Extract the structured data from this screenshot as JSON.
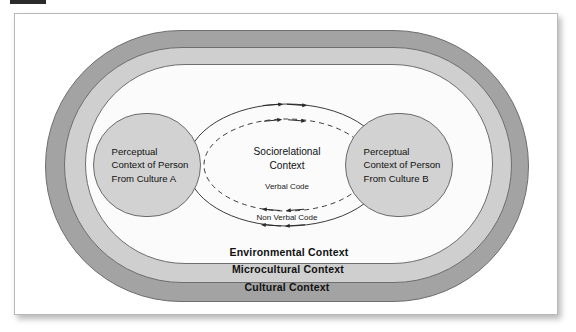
{
  "figure": {
    "bands": [
      {
        "id": "cultural",
        "label": "Cultural Context",
        "color": "#a3a3a3"
      },
      {
        "id": "microcultural",
        "label": "Microcultural Context",
        "color": "#cfcfcf"
      },
      {
        "id": "environmental",
        "label": "Environmental Context",
        "color": "#fbfbfb"
      }
    ],
    "person_a": {
      "label": "Perceptual\nContext of Person\nFrom Culture A"
    },
    "person_b": {
      "label": "Perceptual\nContext of Person\nFrom Culture B"
    },
    "center": {
      "label": "Sociorelational\nContext"
    },
    "codes": {
      "verbal": "Verbal Code",
      "nonverbal": "Non Verbal Code"
    },
    "colors": {
      "cultural_band": "#a3a3a3",
      "microcultural_band": "#cfcfcf",
      "environmental_band": "#fbfbfb",
      "person_circle": "#d2d2d2",
      "outline": "#6b6b6b",
      "text": "#111111",
      "page_background": "#ffffff"
    }
  }
}
